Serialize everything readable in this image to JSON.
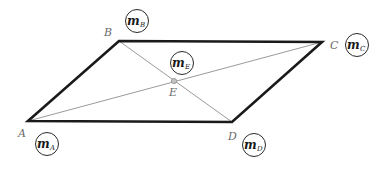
{
  "diagram": {
    "type": "parallelogram-with-diagonals",
    "colors": {
      "edge": "#1a1a1a",
      "diagonal": "#9a9a9a",
      "label": "#6a6a6a",
      "mass_circle": "#2a2a2a",
      "center_point": "#a8a8a8"
    },
    "vertices": [
      {
        "id": "A",
        "label": "A",
        "x": 28,
        "y": 121
      },
      {
        "id": "B",
        "label": "B",
        "x": 119,
        "y": 41
      },
      {
        "id": "C",
        "label": "C",
        "x": 322,
        "y": 42
      },
      {
        "id": "D",
        "label": "D",
        "x": 232,
        "y": 122
      }
    ],
    "center": {
      "id": "E",
      "label": "E",
      "x": 174,
      "y": 81
    },
    "masses": [
      {
        "id": "mA",
        "symbol": "m",
        "subscript": "A"
      },
      {
        "id": "mB",
        "symbol": "m",
        "subscript": "B"
      },
      {
        "id": "mC",
        "symbol": "m",
        "subscript": "C"
      },
      {
        "id": "mD",
        "symbol": "m",
        "subscript": "D"
      },
      {
        "id": "mE",
        "symbol": "m",
        "subscript": "E"
      }
    ],
    "edges": [
      "AB",
      "BC",
      "CD",
      "DA"
    ],
    "diagonals": [
      "AC",
      "BD"
    ]
  }
}
